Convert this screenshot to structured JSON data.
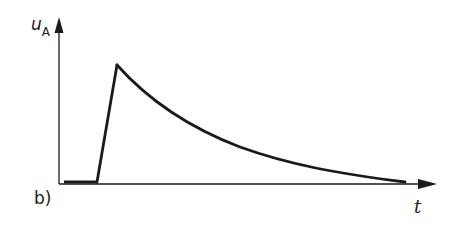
{
  "figure": {
    "panel_label": "b)",
    "y_axis": {
      "symbol": "u",
      "subscript": "A"
    },
    "x_axis": {
      "symbol": "t"
    },
    "colors": {
      "stroke": "#1a1a1a",
      "background": "#ffffff"
    }
  },
  "signal": {
    "description": "Zero baseline, then fast linear rise to a peak, followed by exponential decay toward zero",
    "segments": [
      {
        "type": "baseline",
        "from": [
          64,
          182
        ],
        "to": [
          97,
          182
        ]
      },
      {
        "type": "linear_rise",
        "from": [
          97,
          182
        ],
        "to": [
          117,
          65
        ]
      },
      {
        "type": "exponential_decay",
        "from": [
          117,
          65
        ],
        "to": [
          405,
          182
        ]
      }
    ]
  }
}
